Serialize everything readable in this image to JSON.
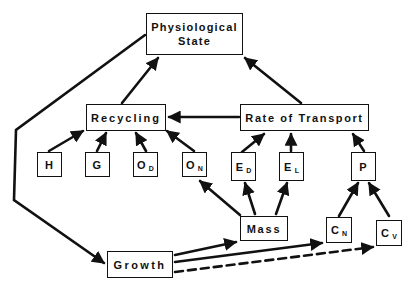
{
  "diagram": {
    "nodes": {
      "physiological_state": {
        "line1": "Physiological",
        "line2": "State"
      },
      "recycling": {
        "label": "Recycling"
      },
      "rate_of_transport": {
        "label": "Rate of Transport"
      },
      "h": {
        "label": "H"
      },
      "g": {
        "label": "G"
      },
      "od": {
        "label": "O",
        "sub": "D"
      },
      "on": {
        "label": "O",
        "sub": "N"
      },
      "ed": {
        "label": "E",
        "sub": "D"
      },
      "el": {
        "label": "E",
        "sub": "L"
      },
      "p": {
        "label": "P"
      },
      "mass": {
        "label": "Mass"
      },
      "cn": {
        "label": "C",
        "sub": "N"
      },
      "cv": {
        "label": "C",
        "sub": "V"
      },
      "growth": {
        "label": "Growth"
      }
    },
    "edges": [
      {
        "from": "Recycling",
        "to": "Physiological State",
        "style": "solid"
      },
      {
        "from": "Rate of Transport",
        "to": "Physiological State",
        "style": "solid"
      },
      {
        "from": "Physiological State",
        "to": "Growth",
        "style": "solid"
      },
      {
        "from": "Rate of Transport",
        "to": "Recycling",
        "style": "solid"
      },
      {
        "from": "H",
        "to": "Recycling",
        "style": "solid"
      },
      {
        "from": "G",
        "to": "Recycling",
        "style": "solid"
      },
      {
        "from": "O_D",
        "to": "Recycling",
        "style": "solid"
      },
      {
        "from": "O_N",
        "to": "Recycling",
        "style": "solid"
      },
      {
        "from": "E_D",
        "to": "Rate of Transport",
        "style": "solid"
      },
      {
        "from": "E_L",
        "to": "Rate of Transport",
        "style": "solid"
      },
      {
        "from": "P",
        "to": "Rate of Transport",
        "style": "solid"
      },
      {
        "from": "Mass",
        "to": "O_N",
        "style": "solid"
      },
      {
        "from": "Mass",
        "to": "E_D",
        "style": "solid"
      },
      {
        "from": "Mass",
        "to": "E_L",
        "style": "solid"
      },
      {
        "from": "C_N",
        "to": "P",
        "style": "solid"
      },
      {
        "from": "C_V",
        "to": "P",
        "style": "solid"
      },
      {
        "from": "Growth",
        "to": "Mass",
        "style": "solid"
      },
      {
        "from": "Growth",
        "to": "C_N",
        "style": "solid"
      },
      {
        "from": "Growth",
        "to": "C_V",
        "style": "dashed"
      }
    ]
  }
}
